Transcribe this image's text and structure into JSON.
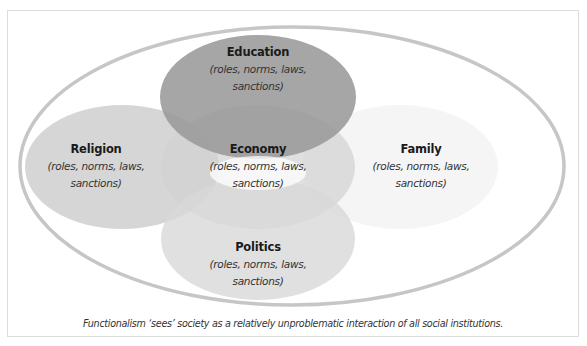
{
  "diagram": {
    "type": "overlapping-ellipses",
    "outer": {
      "name": "society",
      "stroke": "#c4c4c4"
    },
    "institutions": [
      {
        "id": "education",
        "title": "Education",
        "desc_line1": "(roles, norms, laws,",
        "desc_line2": "sanctions)",
        "fill": "#a3a3a3",
        "position": "top"
      },
      {
        "id": "religion",
        "title": "Religion",
        "desc_line1": "(roles, norms, laws,",
        "desc_line2": "sanctions)",
        "fill": "#d6d6d6",
        "position": "left"
      },
      {
        "id": "economy",
        "title": "Economy",
        "desc_line1": "(roles, norms, laws,",
        "desc_line2": "sanctions)",
        "fill": "#d9d9d9",
        "position": "center"
      },
      {
        "id": "family",
        "title": "Family",
        "desc_line1": "(roles, norms, laws,",
        "desc_line2": "sanctions)",
        "fill": "#f3f3f3",
        "position": "right"
      },
      {
        "id": "politics",
        "title": "Politics",
        "desc_line1": "(roles, norms, laws,",
        "desc_line2": "sanctions)",
        "fill": "#dedede",
        "position": "bottom"
      }
    ],
    "caption": "Functionalism ‘sees’ society as a relatively unproblematic interaction of all social institutions."
  }
}
